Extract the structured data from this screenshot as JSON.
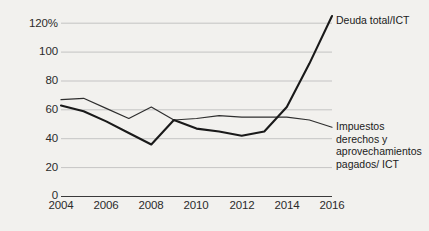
{
  "chart_data": {
    "type": "line",
    "title": "",
    "subtitle": "",
    "xlabel": "",
    "ylabel": "",
    "x": [
      2004,
      2005,
      2006,
      2007,
      2008,
      2009,
      2010,
      2011,
      2012,
      2013,
      2014,
      2015,
      2016
    ],
    "xlim": [
      2004,
      2016
    ],
    "ylim": [
      0,
      120
    ],
    "xtick_labels": [
      "2004",
      "2006",
      "2008",
      "2010",
      "2012",
      "2014",
      "2016"
    ],
    "xtick_values": [
      2004,
      2006,
      2008,
      2010,
      2012,
      2014,
      2016
    ],
    "ytick_labels": [
      "0",
      "20",
      "40",
      "60",
      "80",
      "100",
      "120%"
    ],
    "ytick_values": [
      0,
      20,
      40,
      60,
      80,
      100,
      120
    ],
    "grid": "horizontal",
    "legend_position": "inline-right",
    "series": [
      {
        "name": "Deuda total/ICT",
        "color": "#1a1a1a",
        "width": 2.1,
        "values": [
          63,
          59,
          52,
          44,
          36,
          53,
          47,
          45,
          42,
          45,
          62,
          92,
          125
        ]
      },
      {
        "name": "Impuestos derechos y aprovechamientos pagados/ ICT",
        "color": "#2e2e2e",
        "width": 1.2,
        "values": [
          67,
          68,
          61,
          54,
          62,
          53,
          54,
          56,
          55,
          55,
          55,
          53,
          48
        ]
      }
    ],
    "annotations": [
      {
        "text": "Deuda total/ICT",
        "series": 0
      },
      {
        "text": "Impuestos derechos y aprovechamientos pagados/ ICT",
        "series": 1
      }
    ]
  },
  "labels": {
    "series1": "Deuda total/ICT",
    "series2_line1": "Impuestos",
    "series2_line2": "derechos y",
    "series2_line3": "aprovechamientos",
    "series2_line4": "pagados/ ICT"
  },
  "yticks": {
    "t0": "0",
    "t20": "20",
    "t40": "40",
    "t60": "60",
    "t80": "80",
    "t100": "100",
    "t120": "120%"
  },
  "xticks": {
    "x2004": "2004",
    "x2006": "2006",
    "x2008": "2008",
    "x2010": "2010",
    "x2012": "2012",
    "x2014": "2014",
    "x2016": "2016"
  },
  "colors": {
    "background": "#f2f1ee",
    "grid": "#b9b9b9",
    "axis": "#3a3a3a",
    "series1": "#1a1a1a",
    "series2": "#2e2e2e",
    "text": "#2b2b2b"
  }
}
